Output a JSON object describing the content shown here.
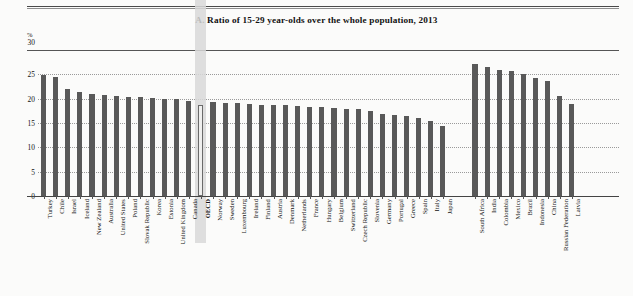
{
  "page": {
    "unit_label": "%",
    "title": "A. Ratio of 15-29 year-olds over the whole population, 2013"
  },
  "chart_data": {
    "type": "bar",
    "title": "A. Ratio of 15-29 year-olds over the whole population, 2013",
    "xlabel": "",
    "ylabel": "%",
    "ylim": [
      0,
      30
    ],
    "yticks": [
      0,
      5,
      10,
      15,
      20,
      25,
      30
    ],
    "grid": true,
    "legend": "none",
    "highlight_category": "OECD",
    "group_gap_after_index": 33,
    "bar_color": "#595959",
    "highlight_bar_color": "#efefee",
    "highlight_band_color": "#d8d8d8",
    "categories": [
      "Turkey",
      "Chile",
      "Israel",
      "Iceland",
      "New Zealand",
      "Australia",
      "United States",
      "Poland",
      "Slovak Republic",
      "Korea",
      "Estonia",
      "United Kingdom",
      "Canada",
      "OECD",
      "Norway",
      "Sweden",
      "Luxembourg",
      "Ireland",
      "Finland",
      "Austria",
      "Denmark",
      "Netherlands",
      "France",
      "Hungary",
      "Belgium",
      "Switzerland",
      "Czech Republic",
      "Slovenia",
      "Germany",
      "Portugal",
      "Greece",
      "Spain",
      "Italy",
      "Japan",
      "South Africa",
      "India",
      "Colombia",
      "Mexico",
      "Brazil",
      "Indonesia",
      "China",
      "Russian Federation",
      "Latvia"
    ],
    "values": [
      24.9,
      24.5,
      22.0,
      21.3,
      20.9,
      20.8,
      20.6,
      20.4,
      20.3,
      20.2,
      20.0,
      19.9,
      19.6,
      18.7,
      19.3,
      19.2,
      19.1,
      19.0,
      18.8,
      18.7,
      18.6,
      18.4,
      18.3,
      18.2,
      18.0,
      17.9,
      17.8,
      17.4,
      16.9,
      16.6,
      16.4,
      16.0,
      15.4,
      14.3,
      27.2,
      26.6,
      25.8,
      25.7,
      25.0,
      24.3,
      23.7,
      20.6,
      18.9
    ]
  }
}
